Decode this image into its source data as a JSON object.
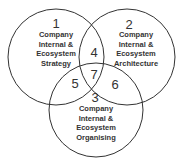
{
  "diagram": {
    "type": "venn",
    "circles": [
      {
        "number": "1",
        "lines": [
          "Company",
          "Internal &",
          "Ecosystem",
          "Strategy"
        ]
      },
      {
        "number": "2",
        "lines": [
          "Company",
          "Internal &",
          "Ecosystem",
          "Architecture"
        ]
      },
      {
        "number": "3",
        "lines": [
          "Company",
          "Internal &",
          "Ecosystem",
          "Organising"
        ]
      }
    ],
    "intersections": {
      "one_two": "4",
      "one_three": "5",
      "two_three": "6",
      "all": "7"
    },
    "stroke_color": "#333333"
  }
}
